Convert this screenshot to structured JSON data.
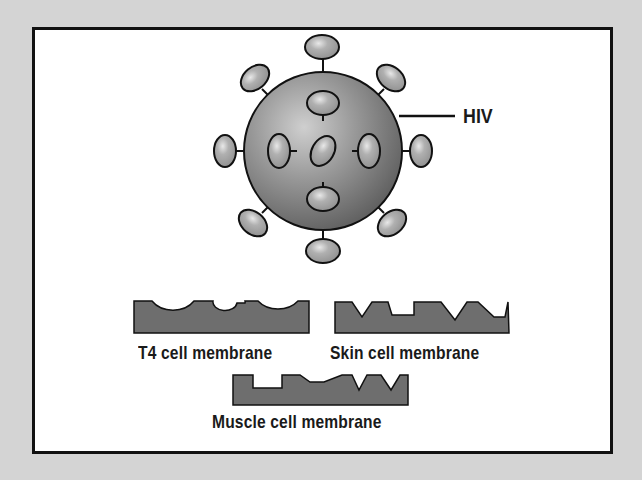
{
  "diagram": {
    "virus": {
      "label": "HIV",
      "icon": "hiv-virus-sphere",
      "body_color": "#8a8a8a",
      "knob_color": "#a8a8a8",
      "outline_color": "#111111"
    },
    "membranes": [
      {
        "id": "t4",
        "label": "T4 cell membrane",
        "receptor_shape": "rounded-cups",
        "fill": "#6e6e6e"
      },
      {
        "id": "skin",
        "label": "Skin cell membrane",
        "receptor_shape": "v-notches-and-square",
        "fill": "#6e6e6e"
      },
      {
        "id": "muscle",
        "label": "Muscle cell membrane",
        "receptor_shape": "square-and-v-notches",
        "fill": "#6e6e6e"
      }
    ],
    "background_color": "#d4d4d4",
    "frame_color": "#ffffff"
  }
}
